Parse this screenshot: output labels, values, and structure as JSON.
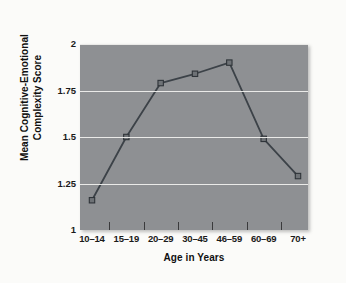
{
  "chart_data": {
    "type": "line",
    "title": "",
    "subtitle": "",
    "xlabel": "Age in Years",
    "ylabel": "Mean Cognitive-Emotional Complexity Score",
    "ylabel_lines": [
      "Mean Cognitive-Emotional",
      "Complexity Score"
    ],
    "categories": [
      "10–14",
      "15–19",
      "20–29",
      "30–45",
      "46–59",
      "60–69",
      "70+"
    ],
    "values": [
      1.16,
      1.5,
      1.79,
      1.84,
      1.9,
      1.49,
      1.29
    ],
    "series": [
      {
        "name": "Mean Cognitive-Emotional Complexity Score",
        "values": [
          1.16,
          1.5,
          1.79,
          1.84,
          1.9,
          1.49,
          1.29
        ]
      }
    ],
    "ylim": [
      1,
      2
    ],
    "yticks": [
      1,
      1.25,
      1.5,
      1.75,
      2
    ],
    "ytick_labels": [
      "1",
      "1.25",
      "1.5",
      "1.75",
      "2"
    ],
    "grid": "horizontal",
    "legend": "none",
    "marker": "square",
    "colors": {
      "plot_background": "#8e9093",
      "page_background": "#fbfbf9",
      "gridline": "#f2f2ef",
      "line": "#3c4248",
      "marker_fill": "#6e7276",
      "marker_edge": "#2f3439",
      "text": "#101010",
      "tick": "#3a3a3c"
    }
  }
}
